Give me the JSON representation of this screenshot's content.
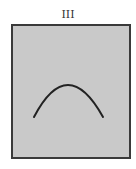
{
  "figure": {
    "label": "III",
    "panel_color": "#c9c9c9",
    "border_color": "#3a3a3a",
    "curve": {
      "shape": "downward-parabola-arc",
      "color": "#222222",
      "start": [
        34,
        117
      ],
      "apex": [
        68,
        85
      ],
      "end": [
        103,
        117
      ]
    }
  }
}
